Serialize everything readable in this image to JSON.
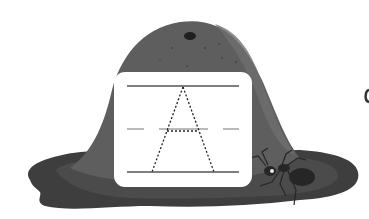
{
  "scene": {
    "subject": "letter tracing worksheet",
    "letter": "A",
    "illustration": "anthill with ant",
    "colors": {
      "background": "#ffffff",
      "mound_main": "#5e5e5e",
      "mound_highlight": "#6e6e6e",
      "base_dark": "#3e3e3e",
      "base_mid": "#4b4b4b",
      "hole": "#1f1f1f",
      "card": "#ffffff",
      "guide_line": "#555555",
      "trace_dots": "#222222",
      "ant": "#262626"
    }
  },
  "tracing_card": {
    "guide_lines": [
      "top-line",
      "dashed-midline",
      "baseline"
    ],
    "trace_letter": "A",
    "trace_style": "dotted"
  }
}
